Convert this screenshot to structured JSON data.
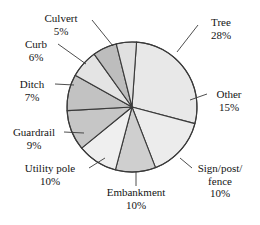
{
  "chart_data": {
    "type": "pie",
    "title": "",
    "subtitle": "",
    "xlabel": "",
    "ylabel": "",
    "legend_position": "none",
    "grid": false,
    "units": "percent",
    "categories": [
      "Tree",
      "Other",
      "Sign/post/fence",
      "Embankment",
      "Utility pole",
      "Guardrail",
      "Ditch",
      "Curb",
      "Culvert"
    ],
    "values": [
      28,
      15,
      10,
      10,
      10,
      9,
      7,
      6,
      5
    ],
    "slices": [
      {
        "label": "Tree",
        "value": 28,
        "value_text": "28%",
        "color": "#e8e8e8",
        "start_angle": 4,
        "end_angle": 104.8
      },
      {
        "label": "Other",
        "value": 15,
        "value_text": "15%",
        "color": "#ececec",
        "start_angle": 104.8,
        "end_angle": 158.8
      },
      {
        "label": "Sign/post/fence",
        "value": 10,
        "value_text": "10%",
        "color": "#cfcfcf",
        "start_angle": 158.8,
        "end_angle": 194.8
      },
      {
        "label": "Embankment",
        "value": 10,
        "value_text": "10%",
        "color": "#efefef",
        "start_angle": 194.8,
        "end_angle": 230.8
      },
      {
        "label": "Utility pole",
        "value": 10,
        "value_text": "10%",
        "color": "#c6c6c6",
        "start_angle": 230.8,
        "end_angle": 266.8
      },
      {
        "label": "Guardrail",
        "value": 9,
        "value_text": "9%",
        "color": "#c2c2c2",
        "start_angle": 266.8,
        "end_angle": 299.2
      },
      {
        "label": "Ditch",
        "value": 7,
        "value_text": "7%",
        "color": "#e4e4e4",
        "start_angle": 299.2,
        "end_angle": 324.4
      },
      {
        "label": "Curb",
        "value": 6,
        "value_text": "6%",
        "color": "#bdbdbd",
        "start_angle": 324.4,
        "end_angle": 346
      },
      {
        "label": "Culvert",
        "value": 5,
        "value_text": "5%",
        "color": "#e0e0e0",
        "start_angle": 346,
        "end_angle": 364
      }
    ]
  },
  "labels": {
    "tree": {
      "name": "Tree",
      "pct": "28%"
    },
    "other": {
      "name": "Other",
      "pct": "15%"
    },
    "sign": {
      "name": "Sign/post/",
      "name2": "fence",
      "pct": "10%"
    },
    "embankment": {
      "name": "Embankment",
      "pct": "10%"
    },
    "utility": {
      "name": "Utility pole",
      "pct": "10%"
    },
    "guardrail": {
      "name": "Guardrail",
      "pct": "9%"
    },
    "ditch": {
      "name": "Ditch",
      "pct": "7%"
    },
    "curb": {
      "name": "Curb",
      "pct": "6%"
    },
    "culvert": {
      "name": "Culvert",
      "pct": "5%"
    }
  },
  "style": {
    "outline_color": "#3a3a3a",
    "background": "#ffffff",
    "text_color": "#141414"
  }
}
